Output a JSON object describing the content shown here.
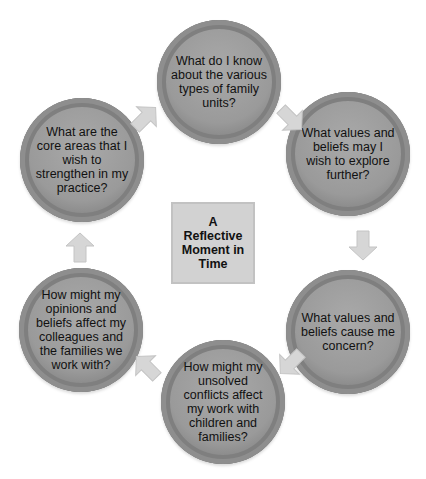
{
  "diagram": {
    "type": "cycle",
    "center": {
      "label": "A Reflective Moment in Time"
    },
    "nodes": [
      {
        "id": "top",
        "label": "What do I know about the various types of family units?"
      },
      {
        "id": "upper-right",
        "label": "What values and beliefs may I wish to explore further?"
      },
      {
        "id": "lower-right",
        "label": "What values and beliefs cause me concern?"
      },
      {
        "id": "bottom",
        "label": "How might my unsolved conflicts affect my work with children and families?"
      },
      {
        "id": "lower-left",
        "label": "How might my opinions and beliefs affect my colleagues and the families we work with?"
      },
      {
        "id": "upper-left",
        "label": "What are the core areas that I wish to strengthen in my practice?"
      }
    ],
    "arrows": [
      {
        "from": "upper-left",
        "to": "top",
        "icon": "arrow-up-right-icon"
      },
      {
        "from": "top",
        "to": "upper-right",
        "icon": "arrow-down-right-icon"
      },
      {
        "from": "upper-right",
        "to": "lower-right",
        "icon": "arrow-down-icon"
      },
      {
        "from": "lower-right",
        "to": "bottom",
        "icon": "arrow-down-left-icon"
      },
      {
        "from": "bottom",
        "to": "lower-left",
        "icon": "arrow-up-left-icon"
      },
      {
        "from": "lower-left",
        "to": "upper-left",
        "icon": "arrow-up-icon"
      }
    ],
    "colors": {
      "node_fill": "#9a9a9a",
      "node_ring": "#7f7f7f",
      "arrow_fill": "#d6d6d6",
      "center_fill": "#d2d2d2",
      "text": "#111111"
    }
  }
}
